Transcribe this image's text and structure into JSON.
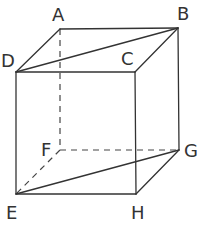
{
  "diagram": {
    "type": "cube",
    "vertices": {
      "A": {
        "label": "A",
        "x": 60,
        "y": 29
      },
      "B": {
        "label": "B",
        "x": 178,
        "y": 28
      },
      "C": {
        "label": "C",
        "x": 135,
        "y": 72
      },
      "D": {
        "label": "D",
        "x": 16,
        "y": 72
      },
      "E": {
        "label": "E",
        "x": 16,
        "y": 194
      },
      "F": {
        "label": "F",
        "x": 60,
        "y": 150
      },
      "G": {
        "label": "G",
        "x": 179,
        "y": 150
      },
      "H": {
        "label": "H",
        "x": 136,
        "y": 194
      }
    },
    "solid_edges": [
      "AB",
      "BC",
      "CD",
      "DA",
      "DE",
      "CH",
      "BG",
      "EH",
      "HG",
      "DB",
      "EG"
    ],
    "dashed_edges": [
      "AF",
      "FE",
      "FG"
    ],
    "diagonals": [
      "DB",
      "EG"
    ],
    "colors": {
      "line": "#333333",
      "background": "#ffffff"
    }
  }
}
